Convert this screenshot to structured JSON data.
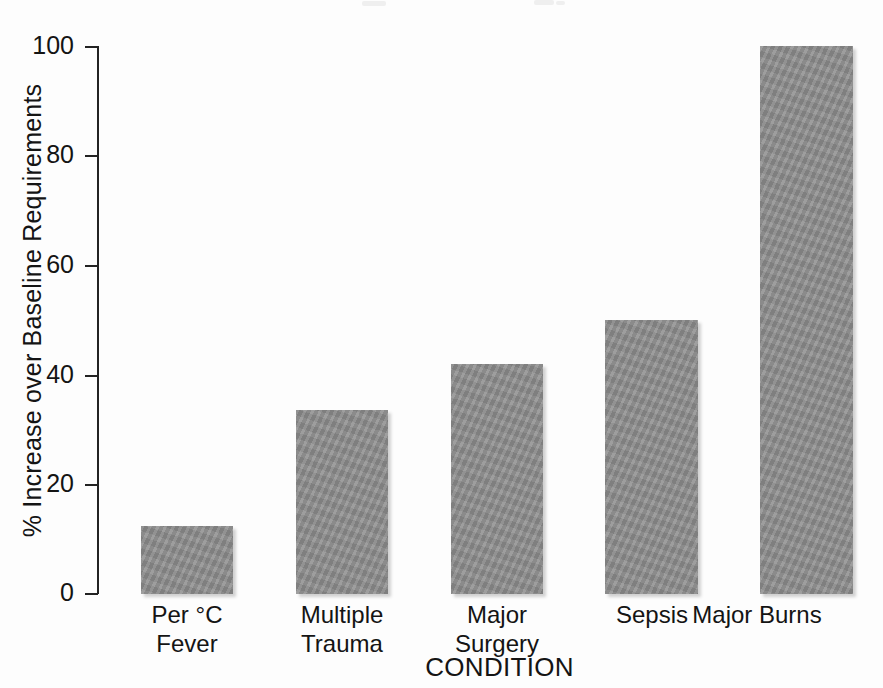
{
  "chart_data": {
    "type": "bar",
    "title": "",
    "subtitle": "",
    "xlabel": "CONDITION",
    "ylabel": "% Increase over Baseline Requirements",
    "categories": [
      "Per °C\nFever",
      "Multiple\nTrauma",
      "Major\nSurgery",
      "Sepsis",
      "Major Burns"
    ],
    "values": [
      12.5,
      33.5,
      42,
      50,
      100
    ],
    "ylim": [
      0,
      100
    ],
    "yticks": [
      0,
      20,
      40,
      60,
      80,
      100
    ],
    "ytick_labels": [
      "0",
      "20",
      "40",
      "60",
      "80",
      "100"
    ],
    "grid": false,
    "legend": null,
    "bar_color": "#8b8b8b",
    "axis_color": "#232323",
    "background_color": "#ffffff"
  },
  "axes": {
    "y_axis_title": "% Increase over Baseline Requirements",
    "x_axis_title": "CONDITION"
  }
}
